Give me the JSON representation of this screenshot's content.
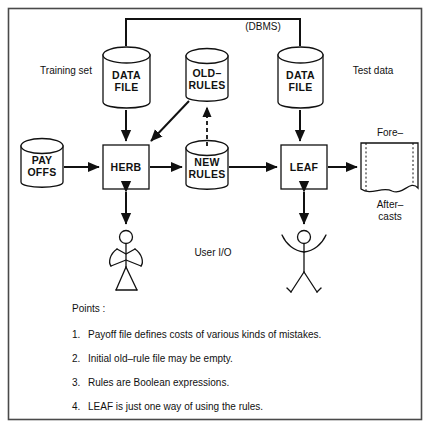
{
  "diagram": {
    "dbms_label": "(DBMS)",
    "side_labels": {
      "left": "Training set",
      "right": "Test data",
      "user_io": "User I/O"
    },
    "nodes": {
      "payoffs": {
        "line1": "PAY",
        "line2": "OFFS",
        "shape": "cylinder"
      },
      "data_file_left": {
        "line1": "DATA",
        "line2": "FILE",
        "shape": "cylinder"
      },
      "old_rules": {
        "line1": "OLD–",
        "line2": "RULES",
        "shape": "cylinder"
      },
      "data_file_right": {
        "line1": "DATA",
        "line2": "FILE",
        "shape": "cylinder"
      },
      "new_rules": {
        "line1": "NEW",
        "line2": "RULES",
        "shape": "cylinder"
      },
      "herb": {
        "line1": "HERB",
        "shape": "box"
      },
      "leaf": {
        "line1": "LEAF",
        "shape": "box"
      },
      "output_doc": {
        "label_top": "Fore–",
        "label_bottom1": "After–",
        "label_bottom2": "casts",
        "shape": "document"
      }
    },
    "points": {
      "heading": "Points :",
      "items": [
        {
          "num": "1.",
          "text": "Payoff file defines costs of various kinds of mistakes."
        },
        {
          "num": "2.",
          "text": "Initial old–rule file may be empty."
        },
        {
          "num": "3.",
          "text": "Rules are Boolean expressions."
        },
        {
          "num": "4.",
          "text": "LEAF is just one way of using the rules."
        }
      ]
    },
    "colors": {
      "ink": "#111111",
      "paper": "#ffffff",
      "frame": "#4a4a4a"
    }
  }
}
